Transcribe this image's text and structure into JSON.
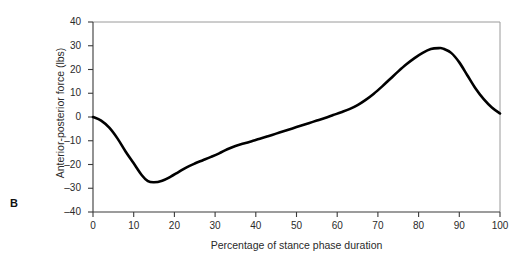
{
  "panel": {
    "label": "B"
  },
  "chart_data": {
    "type": "line",
    "title": "",
    "xlabel": "Percentage of stance phase duration",
    "ylabel": "Anterior-posterior force (lbs)",
    "xlim": [
      0,
      100
    ],
    "ylim": [
      -40,
      40
    ],
    "xticks": [
      0,
      10,
      20,
      30,
      40,
      50,
      60,
      70,
      80,
      90,
      100
    ],
    "yticks": [
      -40,
      -30,
      -20,
      -10,
      0,
      10,
      20,
      30,
      40
    ],
    "xtick_labels": [
      "0",
      "10",
      "20",
      "30",
      "40",
      "50",
      "60",
      "70",
      "80",
      "90",
      "100"
    ],
    "ytick_labels": [
      "-40",
      "-30",
      "-20",
      "-10",
      "0",
      "10",
      "20",
      "30",
      "40"
    ],
    "grid": false,
    "legend": false,
    "line_color": "#000000",
    "line_width": 2.6,
    "series": [
      {
        "name": "Anterior-posterior force",
        "x": [
          0,
          2,
          4,
          6,
          8,
          10,
          12,
          13.5,
          15,
          17,
          19,
          21,
          23,
          25,
          27,
          29,
          31,
          33,
          35,
          37,
          39,
          41,
          43,
          45,
          47,
          49,
          51,
          53,
          55,
          57,
          59,
          61,
          63,
          65,
          67,
          69,
          71,
          73,
          75,
          77,
          79,
          81,
          83,
          85,
          86,
          88,
          90,
          92,
          94,
          96,
          98,
          100
        ],
        "y": [
          0,
          -1.5,
          -4.5,
          -9,
          -14.5,
          -19.5,
          -24.5,
          -27,
          -27.5,
          -26.8,
          -25.2,
          -23.2,
          -21.2,
          -19.6,
          -18.2,
          -16.8,
          -15.3,
          -13.6,
          -12.2,
          -11.2,
          -10.2,
          -9.2,
          -8.1,
          -7.0,
          -5.9,
          -4.8,
          -3.7,
          -2.6,
          -1.5,
          -0.4,
          0.8,
          2.0,
          3.3,
          5.0,
          7.2,
          9.8,
          12.8,
          16.0,
          19.2,
          22.2,
          24.8,
          27.0,
          28.6,
          29.0,
          28.8,
          27.0,
          23.0,
          17.5,
          12.0,
          7.5,
          4.0,
          1.5
        ]
      }
    ]
  },
  "axes": {
    "frame_color": "#9a9a9a",
    "axis_color": "#3a3a3a"
  }
}
